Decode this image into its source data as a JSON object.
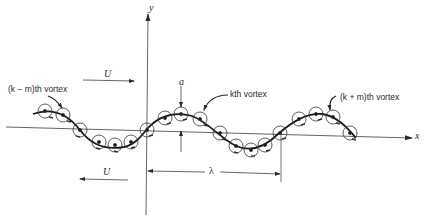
{
  "figure": {
    "axes": {
      "x_label": "x",
      "y_label": "y"
    },
    "flow": {
      "upper_label": "U",
      "lower_label": "U",
      "upper_direction": "right",
      "lower_direction": "left"
    },
    "annotations": {
      "amplitude_label": "a",
      "wavelength_label": "λ",
      "vortex_k_minus_m": "(k − m)th vortex",
      "vortex_k": "kth vortex",
      "vortex_k_plus_m": "(k + m)th vortex"
    },
    "colors": {
      "ink": "#2a2a2a",
      "background": "#ffffff"
    },
    "vortex_count": 19
  }
}
